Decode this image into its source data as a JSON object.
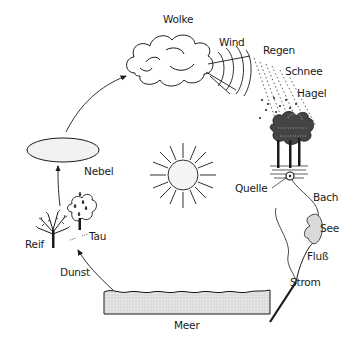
{
  "diagram": {
    "labels": {
      "wolke": "Wolke",
      "wind": "Wind",
      "regen": "Regen",
      "schnee": "Schnee",
      "hagel": "Hagel",
      "nebel": "Nebel",
      "quelle": "Quelle",
      "bach": "Bach",
      "see": "See",
      "fluss": "Fluß",
      "strom": "Strom",
      "meer": "Meer",
      "reif": "Reif",
      "tau": "Tau",
      "dunst": "Dunst"
    },
    "colors": {
      "line": "#1a1a1a",
      "fill_gray": "#d9d9d9",
      "background": "#ffffff"
    }
  }
}
